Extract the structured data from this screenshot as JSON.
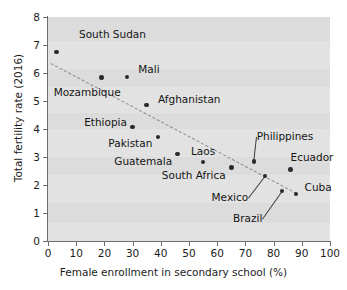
{
  "chart_data": {
    "type": "scatter",
    "title": "",
    "xlabel": "Female enrollment in secondary school (%)",
    "ylabel": "Total fertility rate (2016)",
    "xlim": [
      0,
      100
    ],
    "ylim": [
      0,
      8
    ],
    "xticks": [
      "0",
      "10",
      "20",
      "30",
      "40",
      "50",
      "60",
      "70",
      "80",
      "90",
      "100"
    ],
    "yticks": [
      "0",
      "1",
      "2",
      "3",
      "4",
      "5",
      "6",
      "7",
      "8"
    ],
    "grid": false,
    "legend": "none",
    "points": [
      {
        "label": "South Sudan",
        "x": 3,
        "y": 6.75,
        "lx": 11,
        "ly": 7.35,
        "anchor": "left",
        "leader": false
      },
      {
        "label": "Mozambique",
        "x": 19,
        "y": 5.83,
        "lx": 2,
        "ly": 5.3,
        "anchor": "left",
        "leader": false
      },
      {
        "label": "Mali",
        "x": 28,
        "y": 5.85,
        "lx": 32,
        "ly": 6.12,
        "anchor": "left",
        "leader": false
      },
      {
        "label": "Afghanistan",
        "x": 35,
        "y": 4.86,
        "lx": 39,
        "ly": 5.02,
        "anchor": "left",
        "leader": false
      },
      {
        "label": "Ethiopia",
        "x": 30,
        "y": 4.07,
        "lx": 28,
        "ly": 4.22,
        "anchor": "right",
        "leader": false
      },
      {
        "label": "Pakistan",
        "x": 39,
        "y": 3.72,
        "lx": 37,
        "ly": 3.47,
        "anchor": "right",
        "leader": false
      },
      {
        "label": "Guatemala",
        "x": 46,
        "y": 3.1,
        "lx": 44,
        "ly": 2.82,
        "anchor": "right",
        "leader": false
      },
      {
        "label": "Laos",
        "x": 55,
        "y": 2.82,
        "lx": 55,
        "ly": 3.18,
        "anchor": "center",
        "leader": false
      },
      {
        "label": "South Africa",
        "x": 65,
        "y": 2.62,
        "lx": 63,
        "ly": 2.32,
        "anchor": "right",
        "leader": false
      },
      {
        "label": "Philippines",
        "x": 73,
        "y": 2.83,
        "lx": 74,
        "ly": 3.72,
        "anchor": "left",
        "leader": true
      },
      {
        "label": "Mexico",
        "x": 77,
        "y": 2.32,
        "lx": 71,
        "ly": 1.52,
        "anchor": "right",
        "leader": true
      },
      {
        "label": "Ecuador",
        "x": 86,
        "y": 2.55,
        "lx": 86,
        "ly": 2.95,
        "anchor": "left",
        "leader": false
      },
      {
        "label": "Brazil",
        "x": 83,
        "y": 1.78,
        "lx": 76,
        "ly": 0.78,
        "anchor": "right",
        "leader": true
      },
      {
        "label": "Cuba",
        "x": 88,
        "y": 1.68,
        "lx": 91,
        "ly": 1.88,
        "anchor": "left",
        "leader": false
      }
    ],
    "trendline": {
      "style": "dashed",
      "x0": 1.2,
      "y0": 6.35,
      "x1": 88.5,
      "y1": 1.7
    }
  }
}
